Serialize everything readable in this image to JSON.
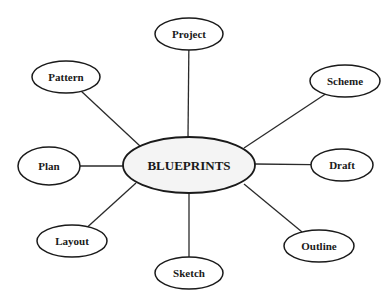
{
  "diagram": {
    "center": {
      "label": "BLUEPRINTS",
      "cx": 189,
      "cy": 165,
      "rx": 66,
      "ry": 28,
      "fill": "#f4f4f4"
    },
    "nodes": [
      {
        "id": "project",
        "label": "Project",
        "cx": 189,
        "cy": 34,
        "rx": 34,
        "ry": 16,
        "ex": 188,
        "ey": 137
      },
      {
        "id": "pattern",
        "label": "Pattern",
        "cx": 66,
        "cy": 77,
        "rx": 34,
        "ry": 16,
        "ex": 140,
        "ey": 146
      },
      {
        "id": "scheme",
        "label": "Scheme",
        "cx": 345,
        "cy": 81,
        "rx": 35,
        "ry": 16,
        "ex": 244,
        "ey": 148
      },
      {
        "id": "plan",
        "label": "Plan",
        "cx": 49,
        "cy": 166,
        "rx": 31,
        "ry": 19,
        "ex": 123,
        "ey": 166
      },
      {
        "id": "draft",
        "label": "Draft",
        "cx": 342,
        "cy": 165,
        "rx": 31,
        "ry": 16,
        "ex": 255,
        "ey": 164
      },
      {
        "id": "layout",
        "label": "Layout",
        "cx": 72,
        "cy": 241,
        "rx": 35,
        "ry": 16,
        "ex": 136,
        "ey": 183
      },
      {
        "id": "sketch",
        "label": "Sketch",
        "cx": 189,
        "cy": 273,
        "rx": 34,
        "ry": 16,
        "ex": 189,
        "ey": 193
      },
      {
        "id": "outline",
        "label": "Outline",
        "cx": 319,
        "cy": 246,
        "rx": 35,
        "ry": 16,
        "ex": 244,
        "ey": 184
      }
    ],
    "stroke_color": "#1a1a1a"
  }
}
